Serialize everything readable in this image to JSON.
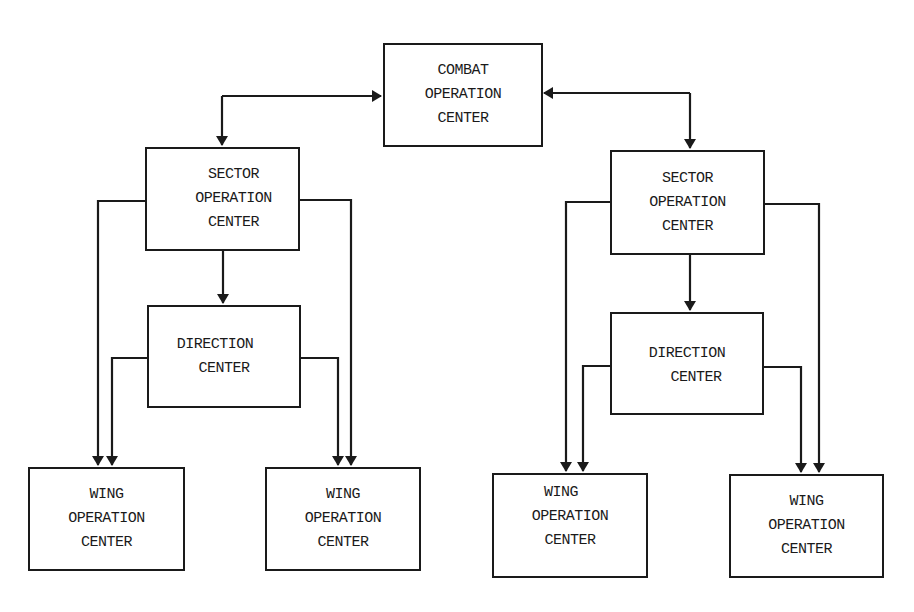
{
  "diagram": {
    "type": "organizational hierarchy / command flow",
    "colors": {
      "line": "#1a1a1a",
      "background": "#ffffff"
    },
    "nodes": {
      "combat": {
        "lines": [
          "COMBAT",
          "OPERATION",
          "CENTER"
        ]
      },
      "sector_left": {
        "lines": [
          "SECTOR",
          "OPERATION",
          "CENTER"
        ]
      },
      "sector_right": {
        "lines": [
          "SECTOR",
          "OPERATION",
          "CENTER"
        ]
      },
      "direction_left": {
        "lines": [
          "DIRECTION",
          "CENTER"
        ]
      },
      "direction_right": {
        "lines": [
          "DIRECTION",
          "CENTER"
        ]
      },
      "wing_1": {
        "lines": [
          "WING",
          "OPERATION",
          "CENTER"
        ]
      },
      "wing_2": {
        "lines": [
          "WING",
          "OPERATION",
          "CENTER"
        ]
      },
      "wing_3": {
        "lines": [
          "WING",
          "OPERATION",
          "CENTER"
        ]
      },
      "wing_4": {
        "lines": [
          "WING",
          "OPERATION",
          "CENTER"
        ]
      }
    },
    "edges": [
      {
        "from": "combat",
        "to": "sector_left",
        "bidirectional": true
      },
      {
        "from": "combat",
        "to": "sector_right",
        "bidirectional": true
      },
      {
        "from": "sector_left",
        "to": "direction_left"
      },
      {
        "from": "sector_left",
        "to": "wing_1"
      },
      {
        "from": "sector_left",
        "to": "wing_2"
      },
      {
        "from": "direction_left",
        "to": "wing_1"
      },
      {
        "from": "direction_left",
        "to": "wing_2"
      },
      {
        "from": "sector_right",
        "to": "direction_right"
      },
      {
        "from": "sector_right",
        "to": "wing_3"
      },
      {
        "from": "sector_right",
        "to": "wing_4"
      },
      {
        "from": "direction_right",
        "to": "wing_3"
      },
      {
        "from": "direction_right",
        "to": "wing_4"
      }
    ]
  }
}
